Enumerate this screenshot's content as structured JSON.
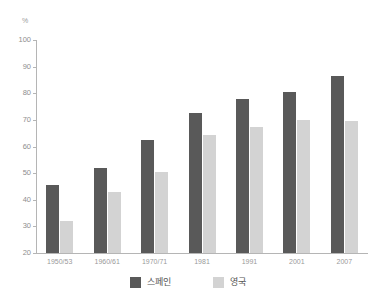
{
  "chart_data": {
    "type": "bar",
    "title": "",
    "xlabel": "",
    "ylabel": "%",
    "ylim": [
      20,
      100
    ],
    "yticks": [
      20,
      30,
      40,
      50,
      60,
      70,
      80,
      90,
      100
    ],
    "grid": false,
    "legend_position": "bottom",
    "categories": [
      "1950/53",
      "1960/61",
      "1970/71",
      "1981",
      "1991",
      "2001",
      "2007"
    ],
    "series": [
      {
        "name": "스페인",
        "color": "#595959",
        "values": [
          45.5,
          52,
          62.5,
          72.5,
          78,
          80.5,
          86.5
        ]
      },
      {
        "name": "영국",
        "color": "#d3d3d3",
        "values": [
          32,
          43,
          50.5,
          64.5,
          67.5,
          70,
          69.5
        ]
      }
    ]
  },
  "axis": {
    "unit_label": "%"
  },
  "colors": {
    "spain": "#595959",
    "uk": "#d3d3d3",
    "axis_line": "#b5b5b5",
    "tick_text": "#8e8e8e",
    "legend_text": "#555555",
    "background": "#ffffff"
  }
}
